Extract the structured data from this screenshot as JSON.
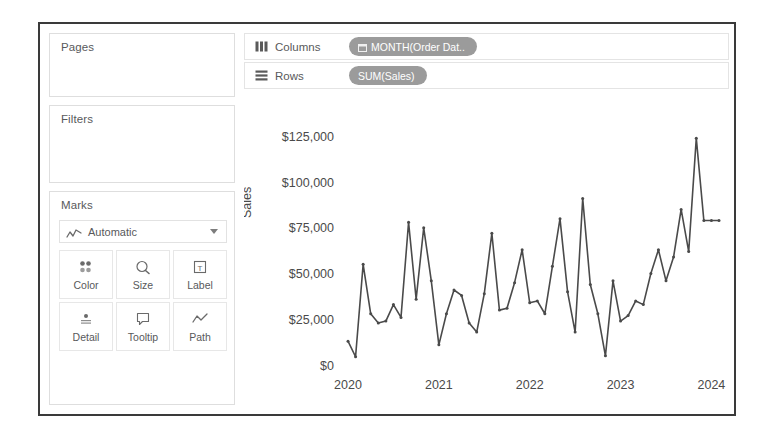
{
  "window": {
    "title": "Tableau Worksheet"
  },
  "left_panel": {
    "pages": {
      "title": "Pages"
    },
    "filters": {
      "title": "Filters"
    },
    "marks": {
      "title": "Marks",
      "mark_type": {
        "label": "Automatic",
        "icon": "line-chart-icon",
        "caret": "chevron-down-icon"
      },
      "buttons": [
        {
          "label": "Color",
          "icon": "color-palette-icon"
        },
        {
          "label": "Size",
          "icon": "size-icon"
        },
        {
          "label": "Label",
          "icon": "label-text-icon"
        },
        {
          "label": "Detail",
          "icon": "detail-icon"
        },
        {
          "label": "Tooltip",
          "icon": "tooltip-icon"
        },
        {
          "label": "Path",
          "icon": "path-line-icon"
        }
      ]
    }
  },
  "shelves": {
    "columns": {
      "label": "Columns",
      "icon": "columns-shelf-icon",
      "pill": "MONTH(Order Dat..",
      "pill_icon": "calendar-icon"
    },
    "rows": {
      "label": "Rows",
      "icon": "rows-shelf-icon",
      "pill": "SUM(Sales)",
      "pill_icon": ""
    }
  },
  "colors": {
    "pill_background": "#9b9b9b",
    "pill_text": "#ffffff",
    "line": "#4a4a4a",
    "panel_border": "#dedede",
    "frame_border": "#3a3a3a",
    "text": "#58595b"
  },
  "chart_data": {
    "type": "line",
    "title": "",
    "xlabel": "",
    "ylabel": "Sales",
    "ylim": [
      0,
      135000
    ],
    "grid": false,
    "legend": false,
    "y_tick_labels": [
      "$0",
      "$25,000",
      "$50,000",
      "$75,000",
      "$100,000",
      "$125,000"
    ],
    "y_tick_values": [
      0,
      25000,
      50000,
      75000,
      100000,
      125000
    ],
    "x_tick_labels": [
      "2020",
      "2021",
      "2022",
      "2023",
      "2024"
    ],
    "x_tick_values": [
      0,
      12,
      24,
      36,
      48
    ],
    "series": [
      {
        "name": "SUM(Sales)",
        "x": [
          0,
          1,
          2,
          3,
          4,
          5,
          6,
          7,
          8,
          9,
          10,
          11,
          12,
          13,
          14,
          15,
          16,
          17,
          18,
          19,
          20,
          21,
          22,
          23,
          24,
          25,
          26,
          27,
          28,
          29,
          30,
          31,
          32,
          33,
          34,
          35,
          36,
          37,
          38,
          39,
          40,
          41,
          42,
          43,
          44,
          45,
          46,
          47,
          48,
          49
        ],
        "values": [
          13000,
          4500,
          55000,
          28000,
          23000,
          24000,
          33000,
          26000,
          78000,
          36000,
          75000,
          46000,
          11000,
          28000,
          41000,
          38000,
          23000,
          18000,
          39000,
          72000,
          30000,
          31000,
          45000,
          63000,
          34000,
          35000,
          28000,
          54000,
          80000,
          40000,
          18000,
          91000,
          44000,
          28000,
          5000,
          46000,
          24000,
          27000,
          35000,
          33000,
          50000,
          63000,
          46000,
          59000,
          85000,
          62000,
          124000,
          79000,
          79000,
          79000
        ]
      }
    ]
  }
}
